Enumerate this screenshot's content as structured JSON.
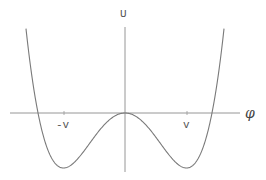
{
  "diagram": {
    "y_axis_label": "U",
    "x_axis_label": "φ",
    "ticks": [
      {
        "label": "-v",
        "x": 64
      },
      {
        "label": "v",
        "x": 187
      }
    ],
    "colors": {
      "axis": "#8a8a8a",
      "curve": "#7a7a7a",
      "text": "#555555"
    }
  },
  "chart_data": {
    "type": "line",
    "title": "",
    "xlabel": "φ",
    "ylabel": "U",
    "tick_labels": [
      "-v",
      "v"
    ],
    "x_minima": [
      -1,
      1
    ],
    "local_max": {
      "x": 0,
      "y": 0
    },
    "roots": [
      -1.41,
      1.41
    ],
    "grid": false,
    "legend": null
  }
}
